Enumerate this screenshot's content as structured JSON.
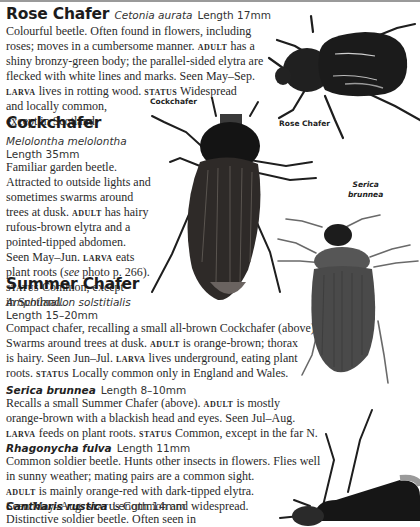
{
  "entries": [
    {
      "id": "rose-chafer",
      "name": "Rose Chafer",
      "scientific": "Cetonia aurata",
      "length": "Length 17mm",
      "lines": [
        [
          "Colourful beetle. Often found in flowers, including"
        ],
        [
          "roses; moves in a cumbersome manner. ",
          {
            "sc": "ADULT"
          },
          " has a"
        ],
        [
          "shiny bronzy-green body; the parallel-sided elytra are"
        ],
        [
          "flecked with white lines and marks. Seen May–Sep."
        ],
        [
          {
            "sc": "LARVA"
          },
          " lives in rotting wood. ",
          {
            "sc": "STATUS"
          },
          " Widespread"
        ],
        [
          "and locally common,"
        ],
        [
          "except in Scotland."
        ]
      ]
    },
    {
      "id": "cockchafer",
      "name": "Cockchafer",
      "scientific": "Melolontha melolontha",
      "length": "Length 35mm",
      "lines": [
        [
          "Familiar garden beetle."
        ],
        [
          "Attracted to outside lights and"
        ],
        [
          "sometimes swarms around"
        ],
        [
          "trees at dusk. ",
          {
            "sc": "ADULT"
          },
          " has hairy"
        ],
        [
          "rufous-brown elytra and a"
        ],
        [
          "pointed-tipped abdomen."
        ],
        [
          "Seen May–Jun. ",
          {
            "sc": "LARVA"
          },
          " eats"
        ],
        [
          "plant roots (",
          {
            "i": "see"
          },
          " photo p. 266)."
        ],
        [
          {
            "sc": "STATUS"
          },
          " Common, except"
        ],
        [
          "in Scotland."
        ]
      ]
    },
    {
      "id": "summer-chafer",
      "name": "Summer Chafer",
      "scientific": "Amphimallon solstitialis",
      "length": "Length 15–20mm",
      "lines": [
        [
          "Compact chafer, recalling a small all-brown Cockchafer (above)."
        ],
        [
          "Swarms around trees at dusk. ",
          {
            "sc": "ADULT"
          },
          " is orange-brown; thorax"
        ],
        [
          "is hairy. Seen Jun–Jul. ",
          {
            "sc": "LARVA"
          },
          " lives underground, eating plant"
        ],
        [
          "roots. ",
          {
            "sc": "STATUS"
          },
          " Locally common only in England and Wales."
        ]
      ]
    },
    {
      "id": "serica-brunnea",
      "scientific": "Serica brunnea",
      "length": "Length 8–10mm",
      "lines": [
        [
          "Recalls a small Summer Chafer (above). ",
          {
            "sc": "ADULT"
          },
          " is mostly"
        ],
        [
          "orange-brown with a blackish head and eyes. Seen Jul–Aug."
        ],
        [
          {
            "sc": "LARVA"
          },
          " feeds on plant roots. ",
          {
            "sc": "STATUS"
          },
          " Common, except in the far N."
        ]
      ]
    },
    {
      "id": "rhagonycha-fulva",
      "scientific": "Rhagonycha fulva",
      "length": "Length 11mm",
      "lines": [
        [
          "Common soldier beetle. Hunts other insects in flowers. Flies well"
        ],
        [
          "in sunny weather; mating pairs are a common sight."
        ],
        [
          {
            "sc": "ADULT"
          },
          " is mainly orange-red with dark-tipped elytra."
        ],
        [
          "Seen May–Aug. ",
          {
            "sc": "STATUS"
          },
          " Common and widespread."
        ]
      ]
    },
    {
      "id": "cantharis-rustica",
      "scientific": "Cantharis rustica",
      "length": "Length 14mm",
      "lines": [
        [
          "Distinctive soldier beetle. Often seen in"
        ]
      ]
    }
  ],
  "captions": {
    "cockchafer": "Cockchafer",
    "rose_chafer": "Rose Chafer",
    "serica_line1": "Serica",
    "serica_line2": "brunnea"
  },
  "colors": {
    "text": "#2a2a2a",
    "heading": "#1c1c1c",
    "beetle_dark": "#1e1e1e",
    "beetle_brown": "#3a3532",
    "serica_body": "#4a4a4a"
  }
}
